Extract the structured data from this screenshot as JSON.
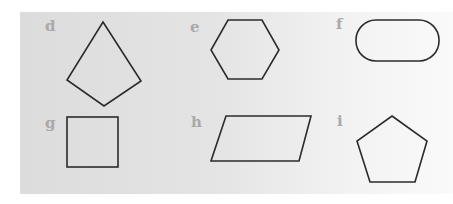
{
  "figure": {
    "panels": [
      {
        "label": "d",
        "shape": "kite"
      },
      {
        "label": "e",
        "shape": "hexagon"
      },
      {
        "label": "f",
        "shape": "oval"
      },
      {
        "label": "g",
        "shape": "square"
      },
      {
        "label": "h",
        "shape": "parallelogram"
      },
      {
        "label": "i",
        "shape": "pentagon"
      }
    ],
    "stroke_color": "#2b2b2b",
    "label_color": "#a9a9a9",
    "background_color": "#dcdcdc"
  }
}
